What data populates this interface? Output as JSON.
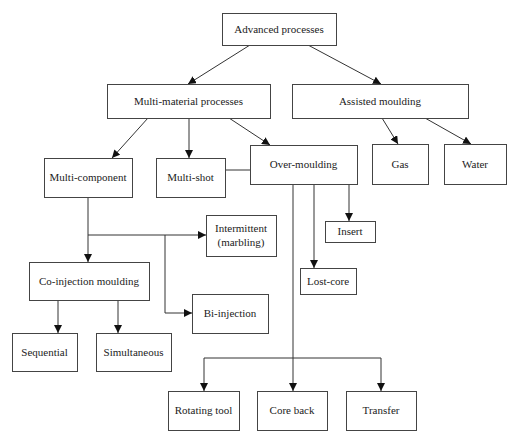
{
  "figure": {
    "clipped_caption_fragment": "",
    "nodes": [
      {
        "id": "advanced",
        "label": "Advanced processes",
        "x": 222,
        "y": 13,
        "w": 114,
        "h": 32
      },
      {
        "id": "multi_material",
        "label": "Multi-material processes",
        "x": 107,
        "y": 84,
        "w": 163,
        "h": 34
      },
      {
        "id": "assisted",
        "label": "Assisted moulding",
        "x": 292,
        "y": 84,
        "w": 176,
        "h": 34
      },
      {
        "id": "multi_component",
        "label": "Multi-component",
        "x": 44,
        "y": 158,
        "w": 88,
        "h": 39
      },
      {
        "id": "multi_shot",
        "label": "Multi-shot",
        "x": 156,
        "y": 158,
        "w": 69,
        "h": 39
      },
      {
        "id": "over_moulding",
        "label": "Over-moulding",
        "x": 250,
        "y": 145,
        "w": 107,
        "h": 39
      },
      {
        "id": "gas",
        "label": "Gas",
        "x": 372,
        "y": 144,
        "w": 56,
        "h": 40
      },
      {
        "id": "water",
        "label": "Water",
        "x": 444,
        "y": 144,
        "w": 62,
        "h": 40
      },
      {
        "id": "intermittent",
        "label": "Intermittent",
        "label2": "(marbling)",
        "x": 206,
        "y": 215,
        "w": 70,
        "h": 41
      },
      {
        "id": "insert",
        "label": "Insert",
        "x": 325,
        "y": 221,
        "w": 50,
        "h": 21
      },
      {
        "id": "lost_core",
        "label": "Lost-core",
        "x": 300,
        "y": 268,
        "w": 56,
        "h": 26
      },
      {
        "id": "co_injection",
        "label": "Co-injection moulding",
        "x": 29,
        "y": 262,
        "w": 120,
        "h": 38
      },
      {
        "id": "bi_injection",
        "label": "Bi-injection",
        "x": 192,
        "y": 294,
        "w": 76,
        "h": 39
      },
      {
        "id": "sequential",
        "label": "Sequential",
        "x": 12,
        "y": 333,
        "w": 65,
        "h": 38
      },
      {
        "id": "simultaneous",
        "label": "Simultaneous",
        "x": 96,
        "y": 333,
        "w": 75,
        "h": 38
      },
      {
        "id": "rotating_tool",
        "label": "Rotating tool",
        "x": 168,
        "y": 391,
        "w": 71,
        "h": 39
      },
      {
        "id": "core_back",
        "label": "Core back",
        "x": 257,
        "y": 391,
        "w": 70,
        "h": 39
      },
      {
        "id": "transfer",
        "label": "Transfer",
        "x": 346,
        "y": 391,
        "w": 70,
        "h": 39
      }
    ],
    "edges": [
      {
        "from": "advanced",
        "to": "multi_material",
        "points": [
          [
            250,
            45
          ],
          [
            188,
            84
          ]
        ]
      },
      {
        "from": "advanced",
        "to": "assisted",
        "points": [
          [
            308,
            45
          ],
          [
            381,
            84
          ]
        ]
      },
      {
        "from": "multi_material",
        "to": "multi_component",
        "points": [
          [
            148,
            118
          ],
          [
            112,
            158
          ]
        ]
      },
      {
        "from": "multi_material",
        "to": "multi_shot",
        "points": [
          [
            189,
            118
          ],
          [
            189,
            158
          ]
        ]
      },
      {
        "from": "multi_material",
        "to": "over_moulding",
        "points": [
          [
            229,
            118
          ],
          [
            270,
            145
          ]
        ]
      },
      {
        "from": "assisted",
        "to": "gas",
        "points": [
          [
            382,
            118
          ],
          [
            398,
            144
          ]
        ]
      },
      {
        "from": "assisted",
        "to": "water",
        "points": [
          [
            425,
            118
          ],
          [
            471,
            144
          ]
        ]
      },
      {
        "from": "multi_component",
        "to": "co_injection",
        "points": [
          [
            88,
            197
          ],
          [
            88,
            262
          ]
        ]
      },
      {
        "from": "multi_component",
        "to": "intermittent",
        "points": [
          [
            88,
            235
          ],
          [
            206,
            235
          ]
        ]
      },
      {
        "from": "multi_component",
        "to": "bi_injection",
        "points": [
          [
            165,
            235
          ],
          [
            165,
            313
          ],
          [
            192,
            313
          ]
        ]
      },
      {
        "from": "over_moulding",
        "to": "lost_core",
        "points": [
          [
            314,
            184
          ],
          [
            314,
            268
          ]
        ]
      },
      {
        "from": "over_moulding",
        "to": "insert",
        "points": [
          [
            349,
            184
          ],
          [
            349,
            221
          ]
        ]
      },
      {
        "from": "co_injection",
        "to": "sequential",
        "points": [
          [
            58,
            300
          ],
          [
            58,
            333
          ]
        ]
      },
      {
        "from": "co_injection",
        "to": "simultaneous",
        "points": [
          [
            118,
            300
          ],
          [
            118,
            333
          ]
        ]
      },
      {
        "from": "multi_shot",
        "to": "core_back",
        "points": [
          [
            225,
            170
          ],
          [
            293,
            170
          ],
          [
            293,
            391
          ]
        ]
      },
      {
        "from": "multi_shot",
        "to": "rotating_tool",
        "points": [
          [
            293,
            358
          ],
          [
            204,
            358
          ],
          [
            204,
            391
          ]
        ]
      },
      {
        "from": "multi_shot",
        "to": "transfer",
        "points": [
          [
            293,
            358
          ],
          [
            381,
            358
          ],
          [
            381,
            391
          ]
        ]
      }
    ]
  }
}
